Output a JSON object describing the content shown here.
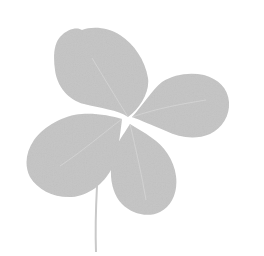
{
  "image": {
    "subject": "four-leaf clover",
    "description": "Grayscale photograph of a four-leaf clover with a thin stem on a white background",
    "colors": {
      "background": "#ffffff",
      "leaf": "#c4c4c4",
      "leaf_edge": "#bdbdbd",
      "vein": "#d6d6d6",
      "stem": "#c9c9c9"
    }
  }
}
